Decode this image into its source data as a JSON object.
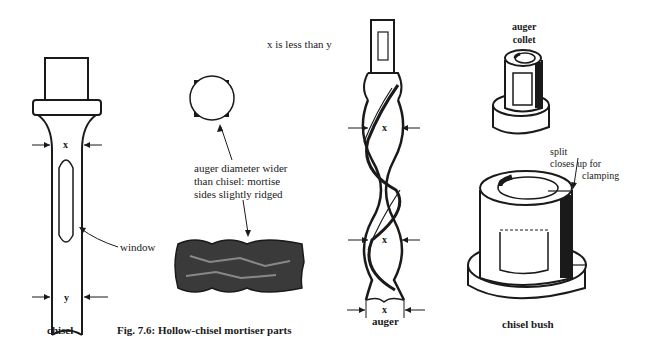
{
  "figure": {
    "caption": "Fig. 7.6: Hollow-chisel mortiser parts",
    "note": "x is less than y"
  },
  "chisel": {
    "label": "chisel",
    "dim_top": "x",
    "dim_bottom": "y",
    "window_label": "window"
  },
  "mortise": {
    "annotation_lines": [
      "auger diameter wider",
      "than chisel: mortise",
      "sides slightly ridged"
    ]
  },
  "auger": {
    "label": "auger",
    "dims": [
      "x",
      "x",
      "x"
    ]
  },
  "collet": {
    "label_lines": [
      "auger",
      "collet"
    ]
  },
  "bush": {
    "label": "chisel bush",
    "split_lines": [
      "split",
      "closes up for",
      "clamping"
    ]
  },
  "colors": {
    "ink": "#1a1a1a",
    "paper": "#ffffff"
  }
}
